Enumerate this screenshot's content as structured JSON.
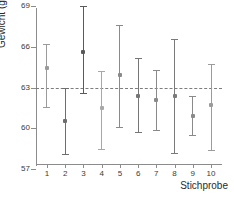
{
  "chart_data": {
    "type": "scatter",
    "title": "",
    "xlabel": "Stichprobe",
    "ylabel": "Gewicht (g)",
    "xlim": [
      0.4,
      10.6
    ],
    "ylim": [
      57,
      69
    ],
    "grid": false,
    "legend": null,
    "y_ticks": [
      57,
      60,
      63,
      66,
      69
    ],
    "y_tick_labels": [
      "57",
      "60",
      "63",
      "66",
      "69"
    ],
    "x_ticks": [
      1,
      2,
      3,
      4,
      5,
      6,
      7,
      8,
      9,
      10
    ],
    "categories": [
      "1",
      "2",
      "3",
      "4",
      "5",
      "6",
      "7",
      "8",
      "9",
      "10"
    ],
    "reference_line": {
      "value": 63,
      "style": "dashed",
      "color": "#7d7d7d",
      "label": ""
    },
    "series": [
      {
        "name": "Stichprobenmittelwert mit Konfidenzintervall",
        "marker": "point",
        "errorbar": true,
        "points": [
          {
            "x": 1,
            "y": 64.4,
            "lower": 61.6,
            "upper": 66.2,
            "color": "#9b9b9b"
          },
          {
            "x": 2,
            "y": 60.5,
            "lower": 58.1,
            "upper": 63.0,
            "color": "#6e6e6e"
          },
          {
            "x": 3,
            "y": 65.6,
            "lower": 62.6,
            "upper": 69.0,
            "color": "#5a5a5a"
          },
          {
            "x": 4,
            "y": 61.5,
            "lower": 58.5,
            "upper": 64.2,
            "color": "#a8a8a8"
          },
          {
            "x": 5,
            "y": 63.9,
            "lower": 60.1,
            "upper": 67.6,
            "color": "#8a8a8a"
          },
          {
            "x": 6,
            "y": 62.4,
            "lower": 59.7,
            "upper": 65.2,
            "color": "#767676"
          },
          {
            "x": 7,
            "y": 62.1,
            "lower": 59.9,
            "upper": 64.3,
            "color": "#8a8a8a"
          },
          {
            "x": 8,
            "y": 62.4,
            "lower": 58.2,
            "upper": 66.6,
            "color": "#7a7a7a"
          },
          {
            "x": 9,
            "y": 60.9,
            "lower": 59.5,
            "upper": 62.4,
            "color": "#8a8a8a"
          },
          {
            "x": 10,
            "y": 61.7,
            "lower": 58.4,
            "upper": 64.7,
            "color": "#9b9b9b"
          }
        ],
        "values": [
          64.4,
          60.5,
          65.6,
          61.5,
          63.9,
          62.4,
          62.1,
          62.4,
          60.9,
          61.7
        ],
        "lower": [
          61.6,
          58.1,
          62.6,
          58.5,
          60.1,
          59.7,
          59.9,
          58.2,
          59.5,
          58.4
        ],
        "upper": [
          66.2,
          63.0,
          69.0,
          64.2,
          67.6,
          65.2,
          64.3,
          66.6,
          62.4,
          64.7
        ]
      }
    ]
  },
  "axis_titles": {
    "y": "Gewicht (g)",
    "x": "Stichprobe"
  }
}
